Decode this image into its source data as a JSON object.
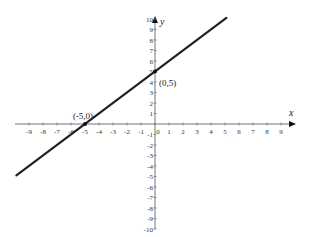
{
  "chart_data": {
    "type": "line",
    "title": "",
    "xlabel": "x",
    "ylabel": "y",
    "xlim": [
      -10,
      10
    ],
    "ylim": [
      -10,
      10
    ],
    "grid": false,
    "x_ticks": [
      -9,
      -8,
      -7,
      -6,
      -5,
      -4,
      -3,
      -2,
      -1,
      0,
      1,
      2,
      3,
      4,
      5,
      6,
      7,
      8,
      9
    ],
    "y_ticks": [
      -10,
      -9,
      -8,
      -7,
      -6,
      -5,
      -4,
      -3,
      -2,
      -1,
      1,
      2,
      3,
      4,
      5,
      6,
      7,
      8,
      9,
      10
    ],
    "series": [
      {
        "name": "y = x + 5",
        "x": [
          -9.9,
          5.1
        ],
        "y": [
          -4.9,
          10.1
        ],
        "color": "#222222"
      }
    ],
    "points": [
      {
        "x": -5,
        "y": 0,
        "label": "(-5,0)"
      },
      {
        "x": 0,
        "y": 5,
        "label": "(0,5)"
      }
    ]
  },
  "layout": {
    "origin_px": [
      155,
      124
    ],
    "px_per_unit_x": 14,
    "px_per_unit_y": 10.5
  }
}
